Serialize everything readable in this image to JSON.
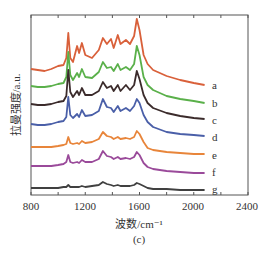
{
  "chart_data": {
    "type": "line",
    "title": "",
    "subtitle": "(c)",
    "xlabel": "波数/cm⁻¹",
    "ylabel": "拉曼强度/a.u.",
    "xlim": [
      800,
      2400
    ],
    "ylim": [
      0,
      180
    ],
    "xticks": [
      800,
      1200,
      1600,
      2000,
      2400
    ],
    "xticks_minor": [
      1000,
      1400,
      1800,
      2200
    ],
    "grid": false,
    "legend": "inline labels at right end of each curve",
    "x": [
      800,
      850,
      900,
      950,
      1000,
      1040,
      1060,
      1075,
      1090,
      1110,
      1140,
      1155,
      1175,
      1200,
      1250,
      1300,
      1330,
      1360,
      1390,
      1410,
      1440,
      1460,
      1500,
      1530,
      1560,
      1580,
      1600,
      1630,
      1660,
      1700,
      1800,
      1900,
      2000,
      2080
    ],
    "series": [
      {
        "name": "a",
        "color": "#d9603a",
        "values": [
          126,
          125,
          124,
          126,
          129,
          130,
          137,
          162,
          137,
          133,
          149,
          142,
          152,
          140,
          137,
          145,
          157,
          151,
          156,
          147,
          160,
          151,
          155,
          151,
          159,
          176,
          165,
          140,
          131,
          125,
          119,
          115,
          112,
          110
        ]
      },
      {
        "name": "b",
        "color": "#5ab04a",
        "values": [
          109,
          108,
          108,
          109,
          111,
          112,
          118,
          143,
          120,
          115,
          122,
          118,
          126,
          118,
          117,
          123,
          133,
          127,
          128,
          124,
          131,
          125,
          128,
          125,
          131,
          149,
          140,
          118,
          110,
          105,
          99,
          96,
          94,
          92
        ]
      },
      {
        "name": "c",
        "color": "#3b2b2b",
        "values": [
          91,
          90,
          90,
          91,
          93,
          94,
          99,
          125,
          103,
          98,
          104,
          100,
          107,
          100,
          100,
          104,
          113,
          107,
          109,
          104,
          110,
          104,
          110,
          105,
          110,
          124,
          116,
          100,
          92,
          87,
          82,
          79,
          77,
          76
        ]
      },
      {
        "name": "d",
        "color": "#4a5fa8",
        "values": [
          71,
          70,
          70,
          71,
          73,
          74,
          78,
          98,
          80,
          77,
          81,
          78,
          85,
          79,
          80,
          84,
          96,
          88,
          87,
          83,
          89,
          84,
          87,
          84,
          89,
          96,
          92,
          80,
          73,
          68,
          63,
          61,
          60,
          59
        ]
      },
      {
        "name": "e",
        "color": "#e8853a",
        "values": [
          48,
          48,
          48,
          48,
          49,
          50,
          51,
          58,
          52,
          51,
          52,
          51,
          54,
          52,
          53,
          56,
          63,
          59,
          58,
          56,
          58,
          56,
          57,
          56,
          58,
          64,
          61,
          53,
          47,
          45,
          43,
          42,
          41,
          41
        ]
      },
      {
        "name": "f",
        "color": "#9a4a9a",
        "values": [
          29,
          29,
          29,
          29,
          30,
          31,
          33,
          40,
          33,
          32,
          33,
          32,
          35,
          33,
          33,
          36,
          44,
          39,
          38,
          36,
          38,
          36,
          37,
          36,
          38,
          43,
          40,
          32,
          28,
          26,
          24,
          23,
          22,
          22
        ]
      },
      {
        "name": "g",
        "color": "#404040",
        "values": [
          7,
          7,
          7,
          7,
          7,
          8,
          8,
          10,
          8,
          8,
          8,
          8,
          9,
          8,
          9,
          10,
          13,
          11,
          10,
          9,
          10,
          9,
          9,
          9,
          10,
          12,
          11,
          9,
          7,
          6,
          6,
          5,
          5,
          5
        ]
      }
    ]
  },
  "axis": {
    "tick_labels": [
      "800",
      "1200",
      "1600",
      "2000",
      "2400"
    ]
  },
  "labels": {
    "y": "拉曼强度/a.u.",
    "x": "波数/cm⁻¹",
    "sub": "(c)",
    "series": [
      "a",
      "b",
      "c",
      "d",
      "e",
      "f",
      "g"
    ]
  }
}
